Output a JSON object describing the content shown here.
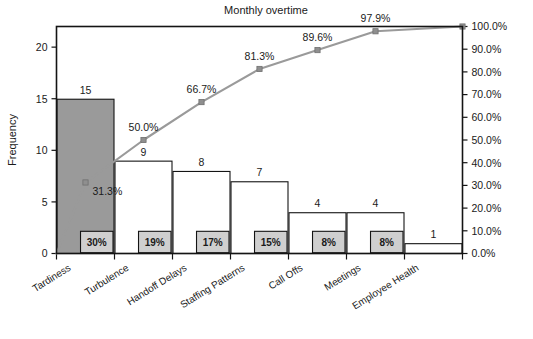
{
  "chart_data": {
    "type": "bar",
    "title": "Monthly overtime",
    "xlabel": "",
    "ylabel": "Frequency",
    "y2label": "",
    "categories": [
      "Tardiness",
      "Turbulence",
      "Handoff Delays",
      "Staffing Patterns",
      "Call Offs",
      "Meetings",
      "Employee Health"
    ],
    "values": [
      15,
      9,
      8,
      7,
      4,
      4,
      1
    ],
    "cumulative_percent": [
      31.3,
      50.0,
      66.7,
      81.3,
      89.6,
      97.9,
      100.0
    ],
    "cumulative_labels": [
      "31.3%",
      "50.0%",
      "66.7%",
      "81.3%",
      "89.6%",
      "97.9%",
      "100.0%"
    ],
    "share_labels": [
      "30%",
      "19%",
      "17%",
      "15%",
      "8%",
      "8%",
      ""
    ],
    "bar_value_labels": [
      "15",
      "9",
      "8",
      "7",
      "4",
      "4",
      "1"
    ],
    "ylim": [
      0,
      22
    ],
    "yticks": [
      0,
      5,
      10,
      15,
      20
    ],
    "ytick_labels": [
      "0",
      "5",
      "10",
      "15",
      "20"
    ],
    "y2lim": [
      0,
      100
    ],
    "y2ticks": [
      0,
      10,
      20,
      30,
      40,
      50,
      60,
      70,
      80,
      90,
      100
    ],
    "y2tick_labels": [
      "0.0%",
      "10.0%",
      "20.0%",
      "30.0%",
      "40.0%",
      "50.0%",
      "60.0%",
      "70.0%",
      "80.0%",
      "90.0%",
      "100.0%"
    ],
    "grid": false,
    "legend": "none",
    "series": [
      {
        "name": "Frequency",
        "type": "bar",
        "values": [
          15,
          9,
          8,
          7,
          4,
          4,
          1
        ]
      },
      {
        "name": "Cumulative %",
        "type": "line",
        "values": [
          31.3,
          50.0,
          66.7,
          81.3,
          89.6,
          97.9,
          100.0
        ]
      }
    ],
    "colors": {
      "highlight_bar_fill": "#9a9a9a",
      "bar_fill": "#ffffff",
      "bar_stroke": "#141414",
      "line": "#9a9a9a",
      "marker": "#8f8f8f",
      "pct_box_fill": "#cfcfcf",
      "text": "#1a1a1a",
      "background": "#ffffff"
    },
    "highlighted_bar_index": 0,
    "category_label_rotation_deg": -32
  }
}
